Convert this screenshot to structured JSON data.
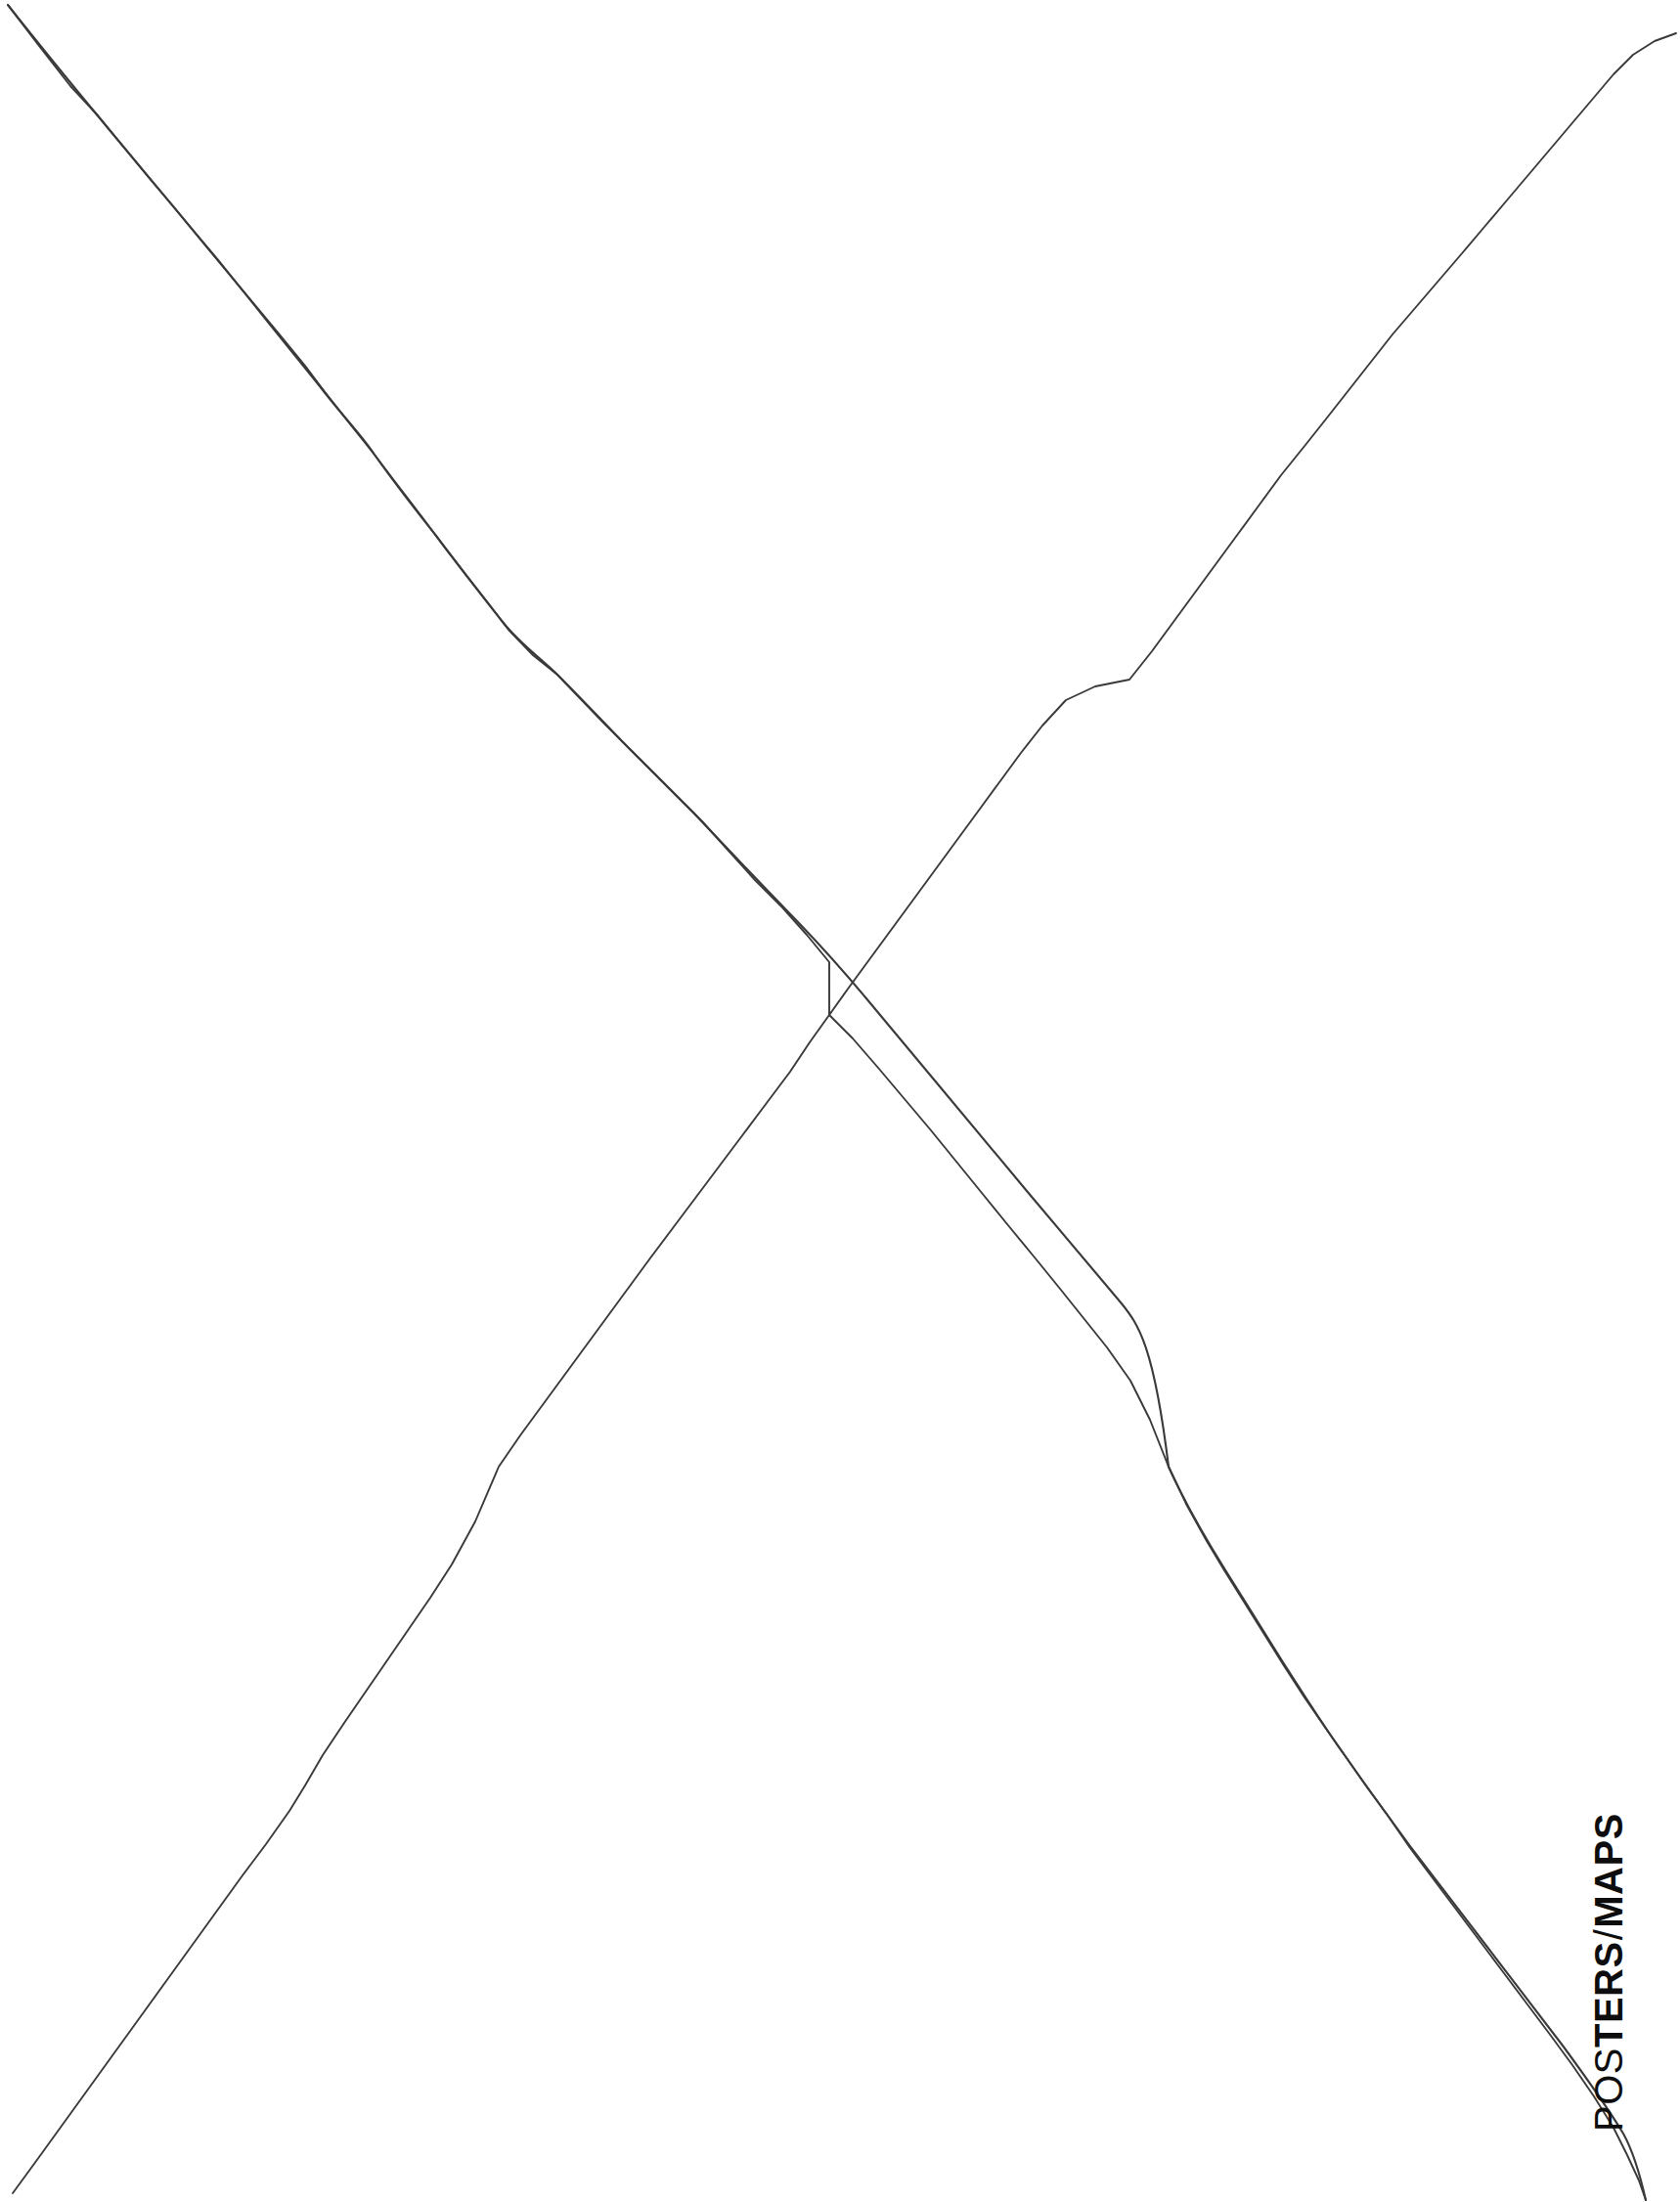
{
  "page": {
    "title": "POSTERS/MAPS",
    "background_color": "#ffffff",
    "width": 1718,
    "height": 2252
  },
  "label": {
    "full_text": "POSTERS/MAPS",
    "orientation": "vertical-rotated-90-ccw",
    "color": "#0d0d0d",
    "segments": [
      {
        "text": "POS",
        "weight": "regular"
      },
      {
        "text": "TERS",
        "weight": "bold"
      },
      {
        "text": "/",
        "weight": "regular"
      },
      {
        "text": "MAPS",
        "weight": "bold"
      }
    ],
    "segment_0": "POS",
    "segment_1": "TERS",
    "segment_2": "/",
    "segment_3": "MAPS"
  },
  "artwork": {
    "type": "hand-drawn-lines",
    "description": "Two hand-drawn wobbling diagonal lines crossing to form a large X across the page",
    "stroke_color": "#3a3a3a",
    "stroke_width": 2,
    "intersection": {
      "x": 848,
      "y": 1038
    },
    "lines": [
      {
        "name": "descending-line",
        "from": {
          "x": 8,
          "y": 5
        },
        "to": {
          "x": 1683,
          "y": 2250
        }
      },
      {
        "name": "ascending-line",
        "from": {
          "x": 13,
          "y": 2243
        },
        "to": {
          "x": 1714,
          "y": 34
        }
      }
    ]
  }
}
